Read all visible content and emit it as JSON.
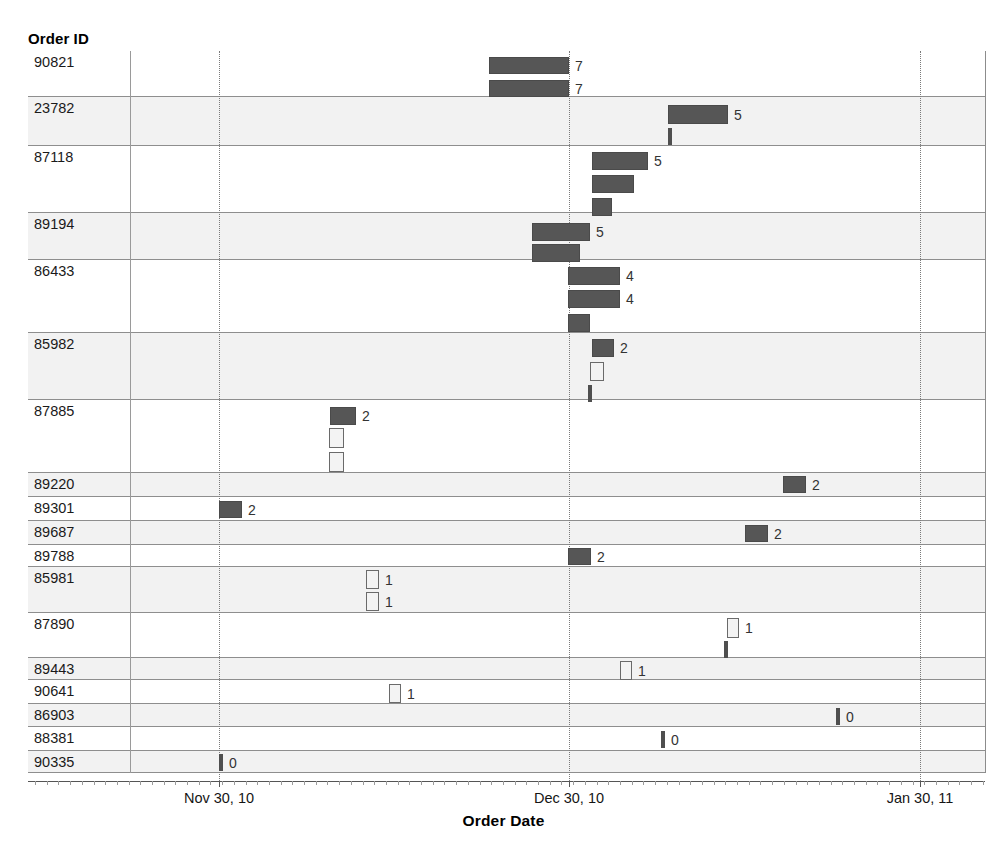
{
  "axes": {
    "y_title": "Order ID",
    "x_title": "Order Date",
    "x_ticks": [
      {
        "label": "Nov 30, 10",
        "x": 219
      },
      {
        "label": "Dec 30, 10",
        "x": 569
      },
      {
        "label": "Jan 30, 11",
        "x": 920
      }
    ]
  },
  "colors": {
    "bar_filled": "#565656",
    "bar_hollow_fill": "#f3f3f3",
    "bar_hollow_border": "#6a6a6a",
    "row_shaded": "#f2f2f2",
    "row_plain": "#ffffff",
    "grid": "#7a7a7a",
    "text": "#1a1a1a"
  },
  "chart_data": {
    "type": "bar",
    "title": "",
    "xlabel": "Order Date",
    "ylabel": "Order ID",
    "orientation": "horizontal",
    "grid": true,
    "legend": "none",
    "x_axis_type": "date",
    "x_tick_labels": [
      "Nov 30, 10",
      "Dec 30, 10",
      "Jan 30, 11"
    ],
    "categories": [
      "90821",
      "23782",
      "87118",
      "89194",
      "86433",
      "85982",
      "87885",
      "89220",
      "89301",
      "89687",
      "89788",
      "85981",
      "87890",
      "89443",
      "90641",
      "86903",
      "88381",
      "90335"
    ],
    "rows": [
      {
        "id": "90821",
        "shaded": false,
        "top": 51,
        "height": 46,
        "bars": [
          {
            "x": 489,
            "y": 57,
            "w": 80,
            "h": 17,
            "style": "filled",
            "label": "7"
          },
          {
            "x": 489,
            "y": 80,
            "w": 80,
            "h": 17,
            "style": "filled",
            "label": "7"
          }
        ]
      },
      {
        "id": "23782",
        "shaded": true,
        "top": 97,
        "height": 49,
        "bars": [
          {
            "x": 668,
            "y": 105,
            "w": 60,
            "h": 19,
            "style": "filled",
            "label": "5"
          },
          {
            "x": 668,
            "y": 128,
            "w": 4,
            "h": 17,
            "style": "tick",
            "label": ""
          }
        ]
      },
      {
        "id": "87118",
        "shaded": false,
        "top": 146,
        "height": 67,
        "bars": [
          {
            "x": 592,
            "y": 152,
            "w": 56,
            "h": 18,
            "style": "filled",
            "label": "5"
          },
          {
            "x": 592,
            "y": 175,
            "w": 42,
            "h": 18,
            "style": "filled",
            "label": ""
          },
          {
            "x": 592,
            "y": 198,
            "w": 20,
            "h": 18,
            "style": "filled",
            "label": ""
          }
        ]
      },
      {
        "id": "89194",
        "shaded": true,
        "top": 213,
        "height": 47,
        "bars": [
          {
            "x": 532,
            "y": 223,
            "w": 58,
            "h": 18,
            "style": "filled",
            "label": "5"
          },
          {
            "x": 532,
            "y": 244,
            "w": 48,
            "h": 18,
            "style": "filled",
            "label": ""
          }
        ]
      },
      {
        "id": "86433",
        "shaded": false,
        "top": 260,
        "height": 73,
        "bars": [
          {
            "x": 568,
            "y": 267,
            "w": 52,
            "h": 18,
            "style": "filled",
            "label": "4"
          },
          {
            "x": 568,
            "y": 290,
            "w": 52,
            "h": 18,
            "style": "filled",
            "label": "4"
          },
          {
            "x": 568,
            "y": 314,
            "w": 22,
            "h": 18,
            "style": "filled",
            "label": ""
          }
        ]
      },
      {
        "id": "85982",
        "shaded": true,
        "top": 333,
        "height": 67,
        "bars": [
          {
            "x": 592,
            "y": 339,
            "w": 22,
            "h": 18,
            "style": "filled",
            "label": "2"
          },
          {
            "x": 590,
            "y": 362,
            "w": 14,
            "h": 19,
            "style": "hollow",
            "label": ""
          },
          {
            "x": 588,
            "y": 385,
            "w": 4,
            "h": 17,
            "style": "tick",
            "label": ""
          }
        ]
      },
      {
        "id": "87885",
        "shaded": false,
        "top": 400,
        "height": 73,
        "bars": [
          {
            "x": 330,
            "y": 407,
            "w": 26,
            "h": 18,
            "style": "filled",
            "label": "2"
          },
          {
            "x": 329,
            "y": 428,
            "w": 15,
            "h": 20,
            "style": "hollow",
            "label": ""
          },
          {
            "x": 329,
            "y": 452,
            "w": 15,
            "h": 20,
            "style": "hollow",
            "label": ""
          }
        ]
      },
      {
        "id": "89220",
        "shaded": true,
        "top": 473,
        "height": 24,
        "bars": [
          {
            "x": 783,
            "y": 476,
            "w": 23,
            "h": 17,
            "style": "filled",
            "label": "2"
          }
        ]
      },
      {
        "id": "89301",
        "shaded": false,
        "top": 497,
        "height": 24,
        "bars": [
          {
            "x": 219,
            "y": 501,
            "w": 23,
            "h": 17,
            "style": "filled",
            "label": "2"
          }
        ]
      },
      {
        "id": "89687",
        "shaded": true,
        "top": 521,
        "height": 24,
        "bars": [
          {
            "x": 745,
            "y": 525,
            "w": 23,
            "h": 17,
            "style": "filled",
            "label": "2"
          }
        ]
      },
      {
        "id": "89788",
        "shaded": false,
        "top": 545,
        "height": 22,
        "bars": [
          {
            "x": 568,
            "y": 548,
            "w": 23,
            "h": 17,
            "style": "filled",
            "label": "2"
          }
        ]
      },
      {
        "id": "85981",
        "shaded": true,
        "top": 567,
        "height": 46,
        "bars": [
          {
            "x": 366,
            "y": 570,
            "w": 13,
            "h": 19,
            "style": "hollow",
            "label": "1"
          },
          {
            "x": 366,
            "y": 592,
            "w": 13,
            "h": 19,
            "style": "hollow",
            "label": "1"
          }
        ]
      },
      {
        "id": "87890",
        "shaded": false,
        "top": 613,
        "height": 45,
        "bars": [
          {
            "x": 727,
            "y": 618,
            "w": 12,
            "h": 20,
            "style": "hollow",
            "label": "1"
          },
          {
            "x": 724,
            "y": 641,
            "w": 4,
            "h": 17,
            "style": "tick",
            "label": ""
          }
        ]
      },
      {
        "id": "89443",
        "shaded": true,
        "top": 658,
        "height": 22,
        "bars": [
          {
            "x": 620,
            "y": 661,
            "w": 12,
            "h": 19,
            "style": "hollow",
            "label": "1"
          }
        ]
      },
      {
        "id": "90641",
        "shaded": false,
        "top": 680,
        "height": 24,
        "bars": [
          {
            "x": 389,
            "y": 684,
            "w": 12,
            "h": 19,
            "style": "hollow",
            "label": "1"
          }
        ]
      },
      {
        "id": "86903",
        "shaded": true,
        "top": 704,
        "height": 23,
        "bars": [
          {
            "x": 836,
            "y": 708,
            "w": 4,
            "h": 17,
            "style": "tick",
            "label": "0"
          }
        ]
      },
      {
        "id": "88381",
        "shaded": false,
        "top": 727,
        "height": 24,
        "bars": [
          {
            "x": 661,
            "y": 731,
            "w": 4,
            "h": 17,
            "style": "tick",
            "label": "0"
          }
        ]
      },
      {
        "id": "90335",
        "shaded": true,
        "top": 751,
        "height": 22,
        "bars": [
          {
            "x": 219,
            "y": 754,
            "w": 4,
            "h": 17,
            "style": "tick",
            "label": "0"
          }
        ]
      }
    ]
  }
}
